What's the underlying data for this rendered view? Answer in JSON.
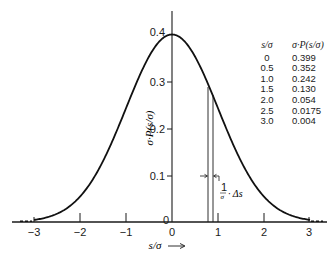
{
  "chart_data": {
    "type": "line",
    "title": "",
    "xlabel": "s/σ",
    "xlabel_arrow": "⟶",
    "ylabel": "σ·P(s/σ)",
    "xlim": [
      -3.3,
      3.3
    ],
    "ylim": [
      0,
      0.43
    ],
    "grid": false,
    "legend": null,
    "x_ticks": [
      "−3",
      "−2",
      "−1",
      "0",
      "1",
      "2",
      "3"
    ],
    "y_ticks": [
      "0",
      "0.1",
      "0.2",
      "0.3",
      "0.4"
    ],
    "series": [
      {
        "name": "Normal distribution σ·P(s/σ)",
        "x": [
          -3.0,
          -2.5,
          -2.0,
          -1.5,
          -1.0,
          -0.5,
          0,
          0.5,
          1.0,
          1.5,
          2.0,
          2.5,
          3.0
        ],
        "values": [
          0.004,
          0.0175,
          0.054,
          0.13,
          0.242,
          0.352,
          0.399,
          0.352,
          0.242,
          0.13,
          0.054,
          0.0175,
          0.004
        ]
      }
    ],
    "annotations": [
      {
        "type": "strip",
        "x_from": 0.78,
        "x_to": 0.88,
        "label": "(1/σ)·Δs"
      }
    ],
    "table": {
      "headers": [
        "s/σ",
        "σ·P(s/σ)"
      ],
      "rows": [
        [
          "0",
          "0.399"
        ],
        [
          "0.5",
          "0.352"
        ],
        [
          "1.0",
          "0.242"
        ],
        [
          "1.5",
          "0.130"
        ],
        [
          "2.0",
          "0.054"
        ],
        [
          "2.5",
          "0.0175"
        ],
        [
          "3.0",
          "0.004"
        ]
      ]
    }
  },
  "labels": {
    "y0": "0",
    "y1": "0.1",
    "y2": "0.2",
    "y3": "0.3",
    "y4": "0.4",
    "xm3": "−3",
    "xm2": "−2",
    "xm1": "−1",
    "x0": "0",
    "x1": "1",
    "x2": "2",
    "x3": "3",
    "xaxis": "s/σ",
    "yaxis": "σ·P(s/σ)",
    "strip_frac_num": "1",
    "strip_frac_den": "σ",
    "strip_rest": "· Δs"
  }
}
